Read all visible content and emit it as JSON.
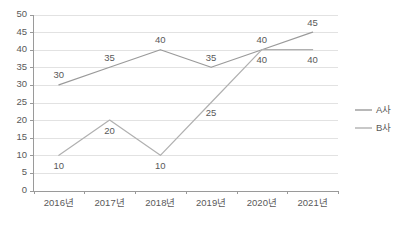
{
  "header": {
    "clipped_text": "···· ··  ·· ··"
  },
  "chart_data": {
    "type": "line",
    "title": "",
    "subtitle": "",
    "xlabel": "",
    "ylabel": "",
    "categories": [
      "2016년",
      "2017년",
      "2018년",
      "2019년",
      "2020년",
      "2021년"
    ],
    "series": [
      {
        "name": "A사",
        "values": [
          30,
          35,
          40,
          35,
          40,
          45
        ],
        "color": "#9a9a9a",
        "label_positions": [
          "above",
          "above",
          "above",
          "above",
          "above",
          "above"
        ]
      },
      {
        "name": "B사",
        "values": [
          10,
          20,
          10,
          25,
          40,
          40
        ],
        "color": "#b0b0b0",
        "label_positions": [
          "below",
          "below",
          "below",
          "below",
          "below",
          "below"
        ]
      }
    ],
    "ylim": [
      0,
      50
    ],
    "ytick_step": 5,
    "yticks": [
      0,
      5,
      10,
      15,
      20,
      25,
      30,
      35,
      40,
      45,
      50
    ],
    "xlim_categories": 6,
    "grid": {
      "horizontal": true,
      "vertical": false
    },
    "legend": {
      "position": "right",
      "entries": [
        {
          "label": "A사",
          "color": "#9a9a9a"
        },
        {
          "label": "B사",
          "color": "#b0b0b0"
        }
      ]
    },
    "axis_colors": {
      "axis": "#9a9a9a",
      "grid": "#e2e2e2",
      "text": "#595959"
    }
  }
}
